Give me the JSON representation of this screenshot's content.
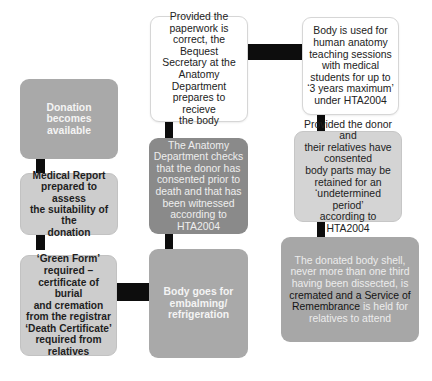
{
  "diagram": {
    "type": "flowchart",
    "colors": {
      "connector": "#0d0d0d",
      "white_box": "#ffffff",
      "mid_grey": "#a9a9a9",
      "light_grey": "#cdcdcd",
      "dark_grey": "#8a8a8a",
      "pale_grey": "#d4d4d4",
      "final_grey": "#a7a7a7"
    },
    "nodes": [
      {
        "id": "donation-available",
        "text": "Donation becomes\navailable"
      },
      {
        "id": "medical-report",
        "text": "Medical Report\nprepared to assess\nthe suitability of the\ndonation"
      },
      {
        "id": "green-form",
        "text": "‘Green Form’\nrequired –\ncertificate of burial\nand cremation\nfrom the registrar\n‘Death Certificate’\nrequired from\nrelatives"
      },
      {
        "id": "body-embalming",
        "text": "Body goes for\nembalming/\nrefrigeration"
      },
      {
        "id": "anatomy-checks",
        "text": "The  Anatomy\nDepartment checks\nthat the donor has\nconsented prior to\ndeath and that has\nbeen witnessed\naccording to HTA2004"
      },
      {
        "id": "bequest-secretary",
        "text": "Provided the\npaperwork is\ncorrect, the Bequest\nSecretary at the\nAnatomy\nDepartment\nprepares to recieve\nthe body"
      },
      {
        "id": "teaching-sessions",
        "text": "Body is used for\nhuman anatomy\nteaching sessions\nwith medical\nstudents for up to\n‘3 years maximum’\nunder HTA2004"
      },
      {
        "id": "body-parts-retained",
        "text": "Provided the donor and\ntheir relatives have\nconsented\nbody parts may be\nretained for an\n‘undetermined period’\naccording to HTA2004"
      },
      {
        "id": "cremation",
        "text_part1": "The donated body shell,\nnever more than one third\nhaving been dissected, is\n",
        "text_part2": "cremated and a Service of\nRemembrance",
        "text_part3": " is held for\nrelatives to attend"
      }
    ],
    "edges": [
      {
        "from": "donation-available",
        "to": "medical-report"
      },
      {
        "from": "medical-report",
        "to": "green-form"
      },
      {
        "from": "green-form",
        "to": "body-embalming"
      },
      {
        "from": "body-embalming",
        "to": "anatomy-checks"
      },
      {
        "from": "anatomy-checks",
        "to": "bequest-secretary"
      },
      {
        "from": "bequest-secretary",
        "to": "teaching-sessions"
      },
      {
        "from": "teaching-sessions",
        "to": "body-parts-retained"
      },
      {
        "from": "body-parts-retained",
        "to": "cremation"
      }
    ]
  }
}
